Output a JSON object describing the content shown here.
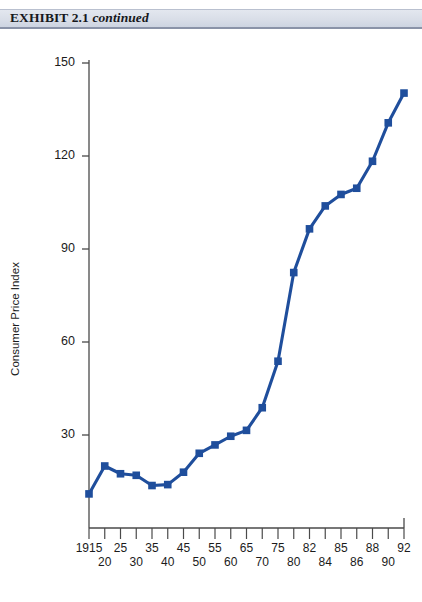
{
  "exhibit": {
    "label": "EXHIBIT 2.1",
    "note": "continued"
  },
  "colors": {
    "series": "#1f4e9c",
    "axis": "#4a4a4a",
    "band_top": "#e3e7ef",
    "band_bottom": "#cdd4e1",
    "band_rule": "#8a93a8",
    "text": "#1b1b1b"
  },
  "chart_data": {
    "type": "line",
    "title": "",
    "xlabel": "",
    "ylabel": "Consumer Price Index",
    "ylim": [
      0,
      150
    ],
    "yticks": [
      30,
      60,
      90,
      120,
      150
    ],
    "ytick_labels": [
      "30",
      "60",
      "90",
      "120",
      "150"
    ],
    "grid": false,
    "legend": "none",
    "marker": "square",
    "categories": [
      "1915",
      "20",
      "25",
      "30",
      "35",
      "40",
      "45",
      "50",
      "55",
      "60",
      "65",
      "70",
      "75",
      "80",
      "82",
      "84",
      "85",
      "86",
      "88",
      "90",
      "92"
    ],
    "xtick_labels_top": [
      "1915",
      "25",
      "35",
      "45",
      "55",
      "65",
      "75",
      "82",
      "85",
      "88",
      "92"
    ],
    "xtick_labels_bottom": [
      "20",
      "30",
      "40",
      "50",
      "60",
      "70",
      "80",
      "84",
      "86",
      "90"
    ],
    "values": [
      11.0,
      20.0,
      17.5,
      17.0,
      13.7,
      14.0,
      18.0,
      24.1,
      26.8,
      29.6,
      31.5,
      38.8,
      53.8,
      82.4,
      96.5,
      103.9,
      107.6,
      109.6,
      118.3,
      130.7,
      140.3
    ],
    "points": [
      {
        "x": "1915",
        "y": 11.0
      },
      {
        "x": "20",
        "y": 20.0
      },
      {
        "x": "25",
        "y": 17.5
      },
      {
        "x": "30",
        "y": 17.0
      },
      {
        "x": "35",
        "y": 13.7
      },
      {
        "x": "40",
        "y": 14.0
      },
      {
        "x": "45",
        "y": 18.0
      },
      {
        "x": "50",
        "y": 24.1
      },
      {
        "x": "55",
        "y": 26.8
      },
      {
        "x": "60",
        "y": 29.6
      },
      {
        "x": "65",
        "y": 31.5
      },
      {
        "x": "70",
        "y": 38.8
      },
      {
        "x": "75",
        "y": 53.8
      },
      {
        "x": "80",
        "y": 82.4
      },
      {
        "x": "82",
        "y": 96.5
      },
      {
        "x": "84",
        "y": 103.9
      },
      {
        "x": "85",
        "y": 107.6
      },
      {
        "x": "86",
        "y": 109.6
      },
      {
        "x": "88",
        "y": 118.3
      },
      {
        "x": "90",
        "y": 130.7
      },
      {
        "x": "92",
        "y": 140.3
      }
    ]
  }
}
